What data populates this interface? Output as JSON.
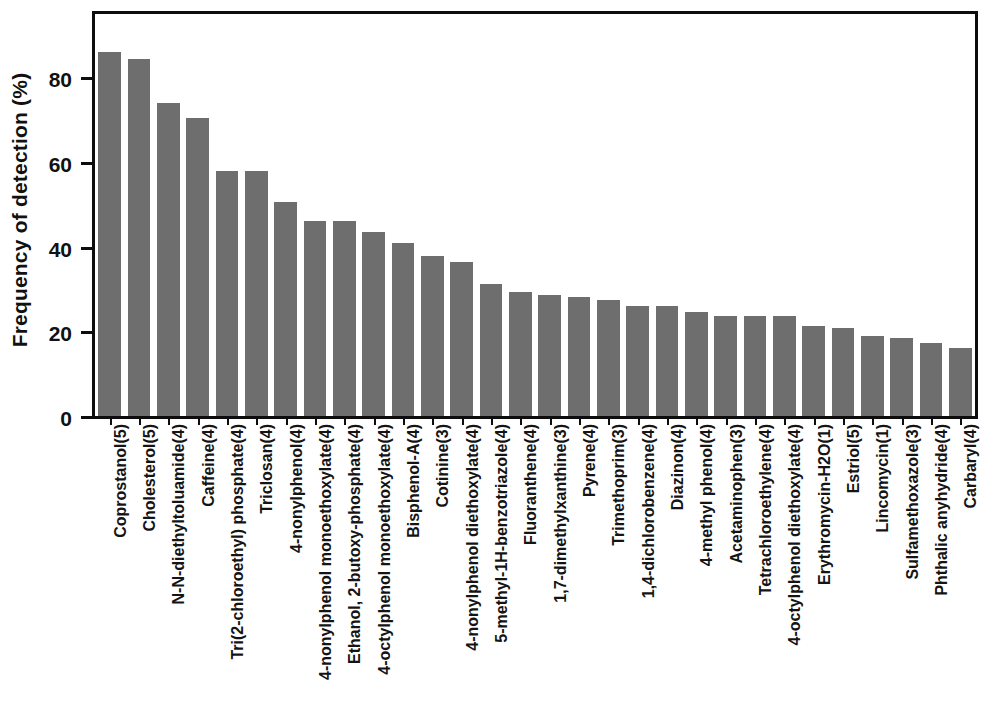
{
  "chart_data": {
    "type": "bar",
    "title": "",
    "xlabel": "",
    "ylabel": "Frequency of detection (%)",
    "ylim": [
      0,
      95
    ],
    "yticks": [
      0,
      20,
      40,
      60,
      80
    ],
    "ytick_labels": [
      "0",
      "20",
      "40",
      "60",
      "80"
    ],
    "grid": false,
    "legend": null,
    "bar_color": "#6e6e6e",
    "axis_color": "#0d0d0d",
    "background": "#ffffff",
    "categories": [
      "Coprostanol(5)",
      "Cholesterol(5)",
      "N-N-diethyltoluamide(4)",
      "Caffeine(4)",
      "Tri(2-chloroethyl) phosphate(4)",
      "Triclosan(4)",
      "4-nonylphenol(4)",
      "4-nonylphenol monoethoxylate(4)",
      "Ethanol, 2-butoxy-phosphate(4)",
      "4-octylphenol monoethoxylate(4)",
      "Bisphenol-A(4)",
      "Cotinine(3)",
      "4-nonylphenol diethoxylate(4)",
      "5-methyl-1H-benzotriazole(4)",
      "Fluoranthene(4)",
      "1,7-dimethylxanthine(3)",
      "Pyrene(4)",
      "Trimethoprim(3)",
      "1,4-dichlorobenzene(4)",
      "Diazinon(4)",
      "4-methyl phenol(4)",
      "Acetaminophen(3)",
      "Tetrachloroethylene(4)",
      "4-octylphenol diethoxylate(4)",
      "Erythromycin-H2O(1)",
      "Estriol(5)",
      "Lincomycin(1)",
      "Sulfamethoxazole(3)",
      "Phthalic anyhydride(4)",
      "Carbaryl(4)"
    ],
    "values": [
      86,
      84.3,
      74,
      70.5,
      57.8,
      57.8,
      50.5,
      46,
      46,
      43.4,
      41,
      37.8,
      36.3,
      31.2,
      29.4,
      28.6,
      28.1,
      27.4,
      26,
      26,
      24.6,
      23.6,
      23.6,
      23.6,
      21.2,
      20.7,
      18.8,
      18.4,
      17.3,
      16.1
    ]
  }
}
